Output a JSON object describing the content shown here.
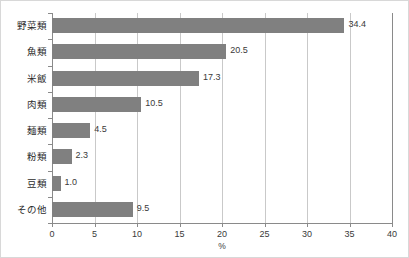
{
  "chart_data": {
    "type": "bar",
    "orientation": "horizontal",
    "title": "",
    "xlabel": "%",
    "ylabel": "",
    "xlim": [
      0,
      40
    ],
    "xticks": [
      "0",
      "5",
      "10",
      "15",
      "20",
      "25",
      "30",
      "35",
      "40"
    ],
    "grid": true,
    "legend": false,
    "bar_color": "#808080",
    "categories": [
      "野菜類",
      "魚類",
      "米飯",
      "肉類",
      "麺類",
      "粉類",
      "豆類",
      "その他"
    ],
    "values": [
      34.4,
      20.5,
      17.3,
      10.5,
      4.5,
      2.3,
      1.0,
      9.5
    ],
    "value_labels": [
      "34.4",
      "20.5",
      "17.3",
      "10.5",
      "4.5",
      "2.3",
      "1.0",
      "9.5"
    ]
  }
}
